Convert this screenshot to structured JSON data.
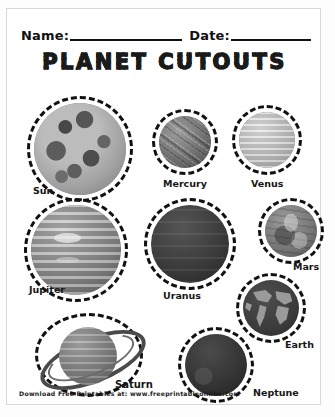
{
  "page": {
    "title": "PLANET CUTOUTS",
    "name_label": "Name:",
    "date_label": "Date:",
    "footer": "Download Free Printables at: www.freeprintableonline.com"
  },
  "planets": [
    {
      "name": "Sun",
      "label": "Sun"
    },
    {
      "name": "Mercury",
      "label": "Mercury"
    },
    {
      "name": "Venus",
      "label": "Venus"
    },
    {
      "name": "Jupiter",
      "label": "Jupiter"
    },
    {
      "name": "Uranus",
      "label": "Uranus"
    },
    {
      "name": "Mars",
      "label": "Mars"
    },
    {
      "name": "Earth",
      "label": "Earth"
    },
    {
      "name": "Saturn",
      "label": "Saturn"
    },
    {
      "name": "Neptune",
      "label": "Neptune"
    }
  ],
  "colors": {
    "ink": "#111111",
    "paper": "#ffffff",
    "border": "#d8d8d8"
  }
}
